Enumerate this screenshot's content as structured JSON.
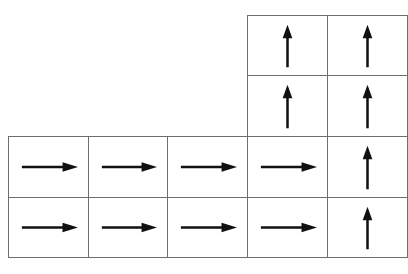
{
  "diagram": {
    "type": "policy-grid",
    "line_color": "#6e6e6e",
    "arrow_color": "#111111",
    "columns_x": [
      8,
      88,
      167,
      247,
      327,
      407
    ],
    "rows_y": [
      15,
      75,
      136,
      197,
      257
    ],
    "cells": [
      {
        "row": 0,
        "col": 3,
        "arrow": "up"
      },
      {
        "row": 0,
        "col": 4,
        "arrow": "up"
      },
      {
        "row": 1,
        "col": 3,
        "arrow": "up"
      },
      {
        "row": 1,
        "col": 4,
        "arrow": "up"
      },
      {
        "row": 2,
        "col": 0,
        "arrow": "right"
      },
      {
        "row": 2,
        "col": 1,
        "arrow": "right"
      },
      {
        "row": 2,
        "col": 2,
        "arrow": "right"
      },
      {
        "row": 2,
        "col": 3,
        "arrow": "right"
      },
      {
        "row": 2,
        "col": 4,
        "arrow": "up"
      },
      {
        "row": 3,
        "col": 0,
        "arrow": "right"
      },
      {
        "row": 3,
        "col": 1,
        "arrow": "right"
      },
      {
        "row": 3,
        "col": 2,
        "arrow": "right"
      },
      {
        "row": 3,
        "col": 3,
        "arrow": "right"
      },
      {
        "row": 3,
        "col": 4,
        "arrow": "up"
      }
    ]
  }
}
